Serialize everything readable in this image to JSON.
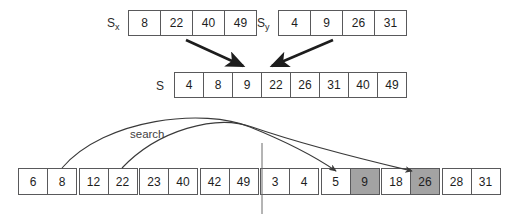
{
  "diagram": {
    "label_search": "search",
    "colors": {
      "stroke": "#59595b",
      "shaded_cell": "#a3a3a3",
      "text": "#1d1d1d",
      "background": "#ffffff"
    }
  },
  "arrays": {
    "sx": {
      "name": "S",
      "subscript": "x",
      "values": [
        "8",
        "22",
        "40",
        "49"
      ]
    },
    "sy": {
      "name": "S",
      "subscript": "y",
      "values": [
        "4",
        "9",
        "26",
        "31"
      ]
    },
    "merged": {
      "name": "S",
      "subscript": "",
      "values": [
        "4",
        "8",
        "9",
        "22",
        "26",
        "31",
        "40",
        "49"
      ]
    }
  },
  "bottom_blocks": [
    {
      "cells": [
        {
          "value": "6",
          "shaded": false
        },
        {
          "value": "8",
          "shaded": false
        }
      ]
    },
    {
      "cells": [
        {
          "value": "12",
          "shaded": false
        },
        {
          "value": "22",
          "shaded": false
        }
      ]
    },
    {
      "cells": [
        {
          "value": "23",
          "shaded": false
        },
        {
          "value": "40",
          "shaded": false
        }
      ]
    },
    {
      "cells": [
        {
          "value": "42",
          "shaded": false
        },
        {
          "value": "49",
          "shaded": false
        }
      ]
    },
    {
      "cells": [
        {
          "value": "3",
          "shaded": false
        },
        {
          "value": "4",
          "shaded": false
        }
      ]
    },
    {
      "cells": [
        {
          "value": "5",
          "shaded": false
        },
        {
          "value": "9",
          "shaded": true
        }
      ]
    },
    {
      "cells": [
        {
          "value": "18",
          "shaded": false
        },
        {
          "value": "26",
          "shaded": true
        }
      ]
    },
    {
      "cells": [
        {
          "value": "28",
          "shaded": false
        },
        {
          "value": "31",
          "shaded": false
        }
      ]
    }
  ]
}
